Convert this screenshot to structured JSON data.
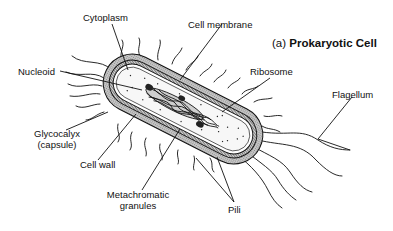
{
  "title": {
    "prefix": "(a)",
    "main": "Prokaryotic Cell"
  },
  "labels": {
    "cytoplasm": "Cytoplasm",
    "cell_membrane": "Cell membrane",
    "nucleoid": "Nucleoid",
    "ribosome": "Ribosome",
    "flagellum": "Flagellum",
    "glycocalyx_line1": "Glycocalyx",
    "glycocalyx_line2": "(capsule)",
    "cell_wall": "Cell wall",
    "metachromatic_line1": "Metachromatic",
    "metachromatic_line2": "granules",
    "pili": "Pili"
  },
  "colors": {
    "ink": "#111111",
    "capsule_fill": "#bdbdbd",
    "wall_fill": "#8f8f8f",
    "cytoplasm_fill": "#f4f4f4",
    "background": "#ffffff"
  }
}
